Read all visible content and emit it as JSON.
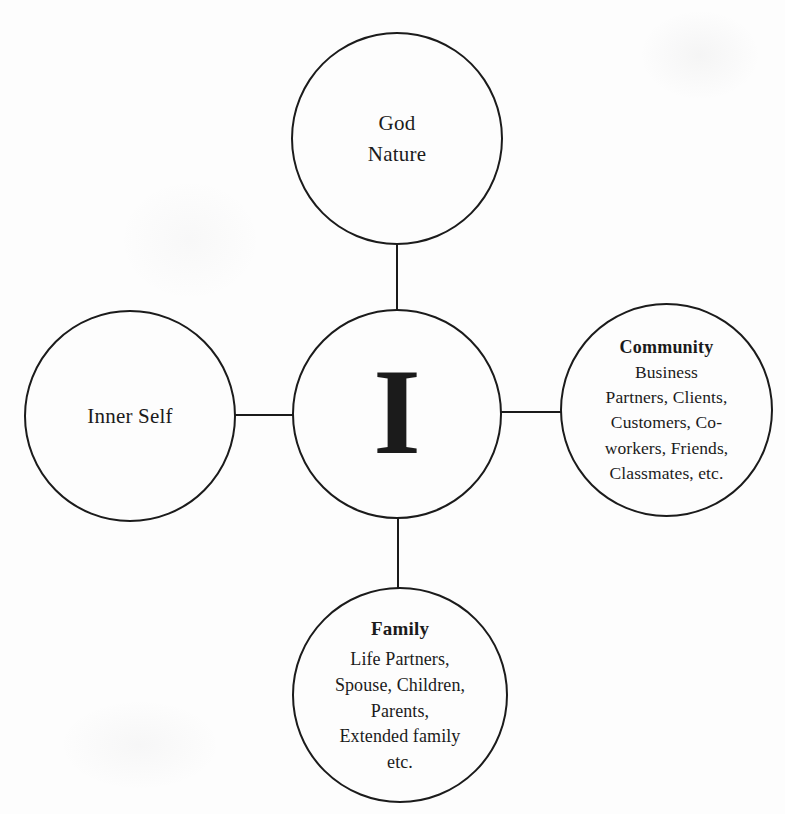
{
  "colors": {
    "ink": "#1b1b1b",
    "paper": "#fdfdfd"
  },
  "diagram": {
    "type": "hub-and-spoke",
    "nodes": {
      "top": {
        "lines": [
          "God",
          "Nature"
        ]
      },
      "left": {
        "lines": [
          "Inner Self"
        ]
      },
      "center": {
        "label": "I"
      },
      "right": {
        "heading": "Community",
        "lines": [
          "Business",
          "Partners, Clients,",
          "Customers, Co-",
          "workers, Friends,",
          "Classmates, etc."
        ]
      },
      "bottom": {
        "heading": "Family",
        "lines": [
          "Life Partners,",
          "Spouse, Children,",
          "Parents,",
          "Extended family",
          "etc."
        ]
      }
    }
  }
}
